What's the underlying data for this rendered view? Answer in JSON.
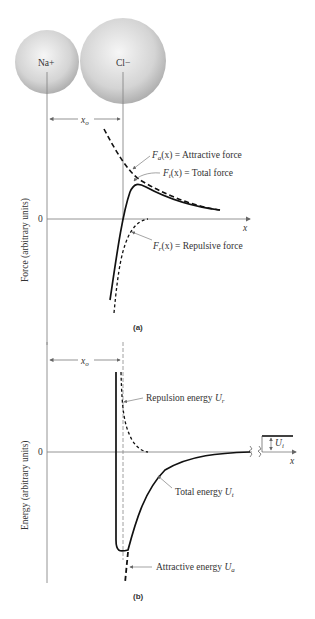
{
  "figure_a": {
    "caption": "(a)",
    "ion_left": "Na+",
    "ion_right": "Cl−",
    "spacing_label": "x",
    "spacing_sub": "o",
    "y_axis_label": "Force (arbitrary units)",
    "zero_label": "0",
    "x_axis_label": "x",
    "curves": [
      {
        "name": "F",
        "sub": "a",
        "text": "(x) = Attractive force",
        "style": "dashed"
      },
      {
        "name": "F",
        "sub": "t",
        "text": "(x) = Total force",
        "style": "solid"
      },
      {
        "name": "F",
        "sub": "r",
        "text": "(x) = Repulsive force",
        "style": "dashed"
      }
    ]
  },
  "figure_b": {
    "caption": "(b)",
    "spacing_label": "x",
    "spacing_sub": "o",
    "y_axis_label": "Energy (arbitrary units)",
    "zero_label": "0",
    "x_axis_label": "x",
    "ionization_label": "U",
    "ionization_sub": "i",
    "curves": [
      {
        "text": "Repulsion energy ",
        "sym": "U",
        "sub": "r",
        "style": "dashed"
      },
      {
        "text": "Total energy ",
        "sym": "U",
        "sub": "t",
        "style": "solid"
      },
      {
        "text": "Attractive energy ",
        "sym": "U",
        "sub": "a",
        "style": "dashed"
      }
    ]
  },
  "colors": {
    "axis": "#888888",
    "curve": "#111111",
    "sphere_light": "#f4f4f4",
    "sphere_dark": "#b5b5b5"
  }
}
